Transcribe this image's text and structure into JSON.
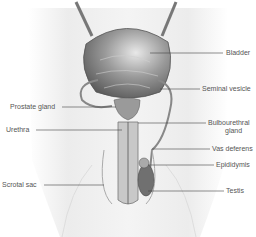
{
  "diagram": {
    "type": "anatomical-illustration",
    "labels": {
      "bladder": "Bladder",
      "seminal_vesicle": "Seminal vesicle",
      "prostate_gland": "Prostate gland",
      "urethra": "Urethra",
      "bulbourethral_gland_1": "Bulbourethral",
      "bulbourethral_gland_2": "gland",
      "vas_deferens": "Vas deferens",
      "epididymis": "Epididymis",
      "scrotal_sac": "Scrotal sac",
      "testis": "Testis"
    },
    "colors": {
      "background": "#ffffff",
      "body": "#eeeeee",
      "organ": "#8a8a8a",
      "leader_line": "#444444",
      "text": "#555555"
    }
  }
}
